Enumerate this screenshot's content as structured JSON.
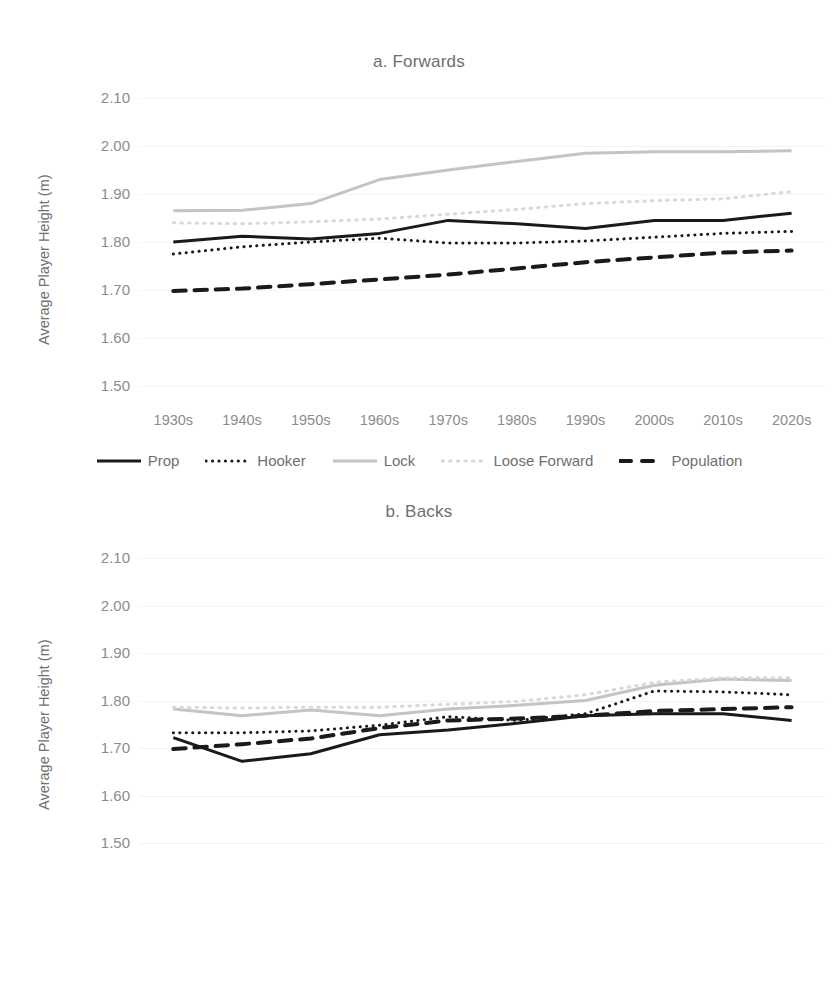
{
  "figure": {
    "ylabel": "Average Player Height (m)",
    "yticks": [
      "2.10",
      "2.00",
      "1.90",
      "1.80",
      "1.70",
      "1.60",
      "1.50"
    ],
    "xticks": [
      "1930s",
      "1940s",
      "1950s",
      "1960s",
      "1970s",
      "1980s",
      "1990s",
      "2000s",
      "2010s",
      "2020s"
    ],
    "colors": {
      "black": "#1a1a1a",
      "gray": "#c4c4c4",
      "light_gray": "#d9d9d9",
      "axis_text": "#8c8c8c",
      "title_text": "#6f6f6f",
      "gridline": "#f3f3f3"
    }
  },
  "chart_data": [
    {
      "type": "line",
      "title": "a. Forwards",
      "xlabel": "",
      "ylabel": "Average Player Height (m)",
      "categories": [
        "1930s",
        "1940s",
        "1950s",
        "1960s",
        "1970s",
        "1980s",
        "1990s",
        "2000s",
        "2010s",
        "2020s"
      ],
      "ylim": [
        1.5,
        2.1
      ],
      "ytick_step": 0.1,
      "grid": true,
      "legend_position": "bottom",
      "series": [
        {
          "name": "Prop",
          "style": "solid",
          "color": "#1a1a1a",
          "width": 3,
          "values": [
            1.8,
            1.812,
            1.806,
            1.818,
            1.845,
            1.838,
            1.828,
            1.845,
            1.845,
            1.86
          ]
        },
        {
          "name": "Hooker",
          "style": "dotted",
          "color": "#1a1a1a",
          "width": 3,
          "values": [
            1.775,
            1.79,
            1.8,
            1.808,
            1.798,
            1.798,
            1.802,
            1.81,
            1.818,
            1.822
          ]
        },
        {
          "name": "Lock",
          "style": "solid",
          "color": "#c4c4c4",
          "width": 3,
          "values": [
            1.865,
            1.866,
            1.88,
            1.93,
            1.95,
            1.968,
            1.985,
            1.988,
            1.988,
            1.99
          ]
        },
        {
          "name": "Loose Forward",
          "style": "fine-dotted",
          "color": "#d9d9d9",
          "width": 3,
          "values": [
            1.84,
            1.838,
            1.842,
            1.848,
            1.858,
            1.868,
            1.88,
            1.886,
            1.89,
            1.905
          ]
        },
        {
          "name": "Population",
          "style": "dashed",
          "color": "#1a1a1a",
          "width": 4,
          "values": [
            1.698,
            1.703,
            1.712,
            1.722,
            1.732,
            1.745,
            1.758,
            1.768,
            1.778,
            1.782
          ]
        }
      ]
    },
    {
      "type": "line",
      "title": "b. Backs",
      "xlabel": "",
      "ylabel": "Average Player Height (m)",
      "categories": [
        "1930s",
        "1940s",
        "1950s",
        "1960s",
        "1970s",
        "1980s",
        "1990s",
        "2000s",
        "2010s",
        "2020s"
      ],
      "ylim": [
        1.5,
        2.1
      ],
      "ytick_step": 0.1,
      "grid": true,
      "legend_position": "bottom",
      "series": [
        {
          "name": "Scrum-Half",
          "style": "solid",
          "color": "#1a1a1a",
          "width": 3,
          "values": [
            1.722,
            1.672,
            1.688,
            1.728,
            1.738,
            1.752,
            1.768,
            1.772,
            1.772,
            1.758
          ]
        },
        {
          "name": "Fly-Half",
          "style": "dotted",
          "color": "#1a1a1a",
          "width": 3,
          "values": [
            1.732,
            1.732,
            1.736,
            1.748,
            1.766,
            1.758,
            1.772,
            1.82,
            1.818,
            1.812
          ]
        },
        {
          "name": "Centre",
          "style": "solid",
          "color": "#c4c4c4",
          "width": 3,
          "values": [
            1.782,
            1.768,
            1.78,
            1.768,
            1.782,
            1.79,
            1.8,
            1.832,
            1.845,
            1.842
          ]
        },
        {
          "name": "Outside Back",
          "style": "fine-dotted",
          "color": "#d9d9d9",
          "width": 3,
          "values": [
            1.786,
            1.784,
            1.786,
            1.786,
            1.792,
            1.798,
            1.812,
            1.838,
            1.848,
            1.848
          ]
        },
        {
          "name": "Population",
          "style": "dashed",
          "color": "#1a1a1a",
          "width": 4,
          "values": [
            1.698,
            1.708,
            1.72,
            1.742,
            1.758,
            1.762,
            1.768,
            1.778,
            1.782,
            1.786
          ]
        }
      ]
    }
  ]
}
